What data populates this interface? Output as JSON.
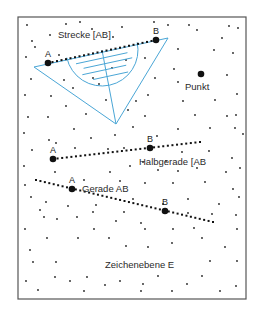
{
  "frame": {
    "x": 18,
    "y": 17,
    "w": 228,
    "h": 282,
    "stroke": "#555555"
  },
  "colors": {
    "ink": "#111111",
    "ruler": "#4aa6d6",
    "dot": "#222222"
  },
  "labels": {
    "strecke": "Strecke [AB]",
    "punkt": "Punkt",
    "halbgerade": "Halbgerade [AB",
    "gerade": "Gerade AB",
    "zeichenebene": "Zeichenebene E"
  },
  "points": {
    "strecke_a": {
      "label": "A",
      "x": 48,
      "y": 63
    },
    "strecke_b": {
      "label": "B",
      "x": 156,
      "y": 40
    },
    "punkt": {
      "x": 201,
      "y": 74
    },
    "halbgerade_a": {
      "label": "A",
      "x": 53,
      "y": 159
    },
    "halbgerade_b": {
      "label": "B",
      "x": 150,
      "y": 148
    },
    "gerade_a": {
      "label": "A",
      "x": 72,
      "y": 189
    },
    "gerade_b": {
      "label": "B",
      "x": 165,
      "y": 211
    }
  },
  "lines": {
    "strecke": {
      "x1": 48,
      "y1": 63,
      "x2": 156,
      "y2": 40
    },
    "halbgerade": {
      "x1": 53,
      "y1": 159,
      "x2": 200,
      "y2": 142
    },
    "gerade": {
      "x1": 36,
      "y1": 180,
      "x2": 213,
      "y2": 222
    }
  },
  "ruler": {
    "triangle": [
      [
        34,
        67
      ],
      [
        168,
        38
      ],
      [
        116,
        124
      ]
    ],
    "protractor": {
      "cx": 102,
      "cy": 50,
      "r": 36
    }
  },
  "scatter_dots": [
    [
      27,
      25
    ],
    [
      50,
      35
    ],
    [
      32,
      41
    ],
    [
      66,
      24
    ],
    [
      80,
      22
    ],
    [
      92,
      29
    ],
    [
      122,
      27
    ],
    [
      154,
      22
    ],
    [
      168,
      25
    ],
    [
      189,
      25
    ],
    [
      197,
      30
    ],
    [
      229,
      26
    ],
    [
      238,
      28
    ],
    [
      26,
      57
    ],
    [
      35,
      47
    ],
    [
      59,
      55
    ],
    [
      113,
      37
    ],
    [
      222,
      38
    ],
    [
      178,
      49
    ],
    [
      214,
      50
    ],
    [
      233,
      53
    ],
    [
      31,
      79
    ],
    [
      51,
      96
    ],
    [
      25,
      95
    ],
    [
      64,
      80
    ],
    [
      73,
      88
    ],
    [
      93,
      78
    ],
    [
      99,
      84
    ],
    [
      112,
      68
    ],
    [
      126,
      60
    ],
    [
      145,
      58
    ],
    [
      174,
      69
    ],
    [
      178,
      82
    ],
    [
      227,
      75
    ],
    [
      237,
      94
    ],
    [
      236,
      115
    ],
    [
      155,
      78
    ],
    [
      136,
      101
    ],
    [
      148,
      95
    ],
    [
      183,
      101
    ],
    [
      215,
      100
    ],
    [
      28,
      117
    ],
    [
      48,
      117
    ],
    [
      66,
      106
    ],
    [
      86,
      114
    ],
    [
      106,
      100
    ],
    [
      128,
      110
    ],
    [
      145,
      116
    ],
    [
      195,
      115
    ],
    [
      227,
      116
    ],
    [
      24,
      133
    ],
    [
      49,
      140
    ],
    [
      74,
      129
    ],
    [
      91,
      138
    ],
    [
      115,
      135
    ],
    [
      133,
      127
    ],
    [
      157,
      136
    ],
    [
      178,
      129
    ],
    [
      210,
      128
    ],
    [
      235,
      128
    ],
    [
      243,
      134
    ],
    [
      32,
      150
    ],
    [
      56,
      143
    ],
    [
      75,
      148
    ],
    [
      108,
      149
    ],
    [
      124,
      148
    ],
    [
      143,
      162
    ],
    [
      166,
      161
    ],
    [
      182,
      152
    ],
    [
      209,
      151
    ],
    [
      232,
      158
    ],
    [
      240,
      168
    ],
    [
      24,
      166
    ],
    [
      55,
      172
    ],
    [
      110,
      172
    ],
    [
      130,
      166
    ],
    [
      158,
      170
    ],
    [
      178,
      171
    ],
    [
      197,
      168
    ],
    [
      226,
      172
    ],
    [
      25,
      185
    ],
    [
      84,
      180
    ],
    [
      120,
      181
    ],
    [
      145,
      183
    ],
    [
      173,
      183
    ],
    [
      205,
      182
    ],
    [
      233,
      189
    ],
    [
      31,
      197
    ],
    [
      46,
      202
    ],
    [
      68,
      206
    ],
    [
      96,
      205
    ],
    [
      133,
      199
    ],
    [
      163,
      204
    ],
    [
      188,
      199
    ],
    [
      219,
      204
    ],
    [
      239,
      197
    ],
    [
      40,
      210
    ],
    [
      57,
      219
    ],
    [
      93,
      212
    ],
    [
      124,
      212
    ],
    [
      141,
      223
    ],
    [
      188,
      213
    ],
    [
      212,
      214
    ],
    [
      236,
      215
    ],
    [
      44,
      217
    ],
    [
      77,
      217
    ],
    [
      94,
      229
    ],
    [
      116,
      221
    ],
    [
      145,
      229
    ],
    [
      173,
      229
    ],
    [
      194,
      228
    ],
    [
      237,
      229
    ],
    [
      25,
      229
    ],
    [
      47,
      238
    ],
    [
      78,
      238
    ],
    [
      109,
      238
    ],
    [
      126,
      246
    ],
    [
      148,
      247
    ],
    [
      172,
      243
    ],
    [
      202,
      238
    ],
    [
      225,
      247
    ],
    [
      30,
      250
    ],
    [
      56,
      262
    ],
    [
      33,
      262
    ],
    [
      210,
      261
    ],
    [
      237,
      261
    ],
    [
      55,
      277
    ],
    [
      70,
      281
    ],
    [
      87,
      277
    ],
    [
      158,
      276
    ],
    [
      202,
      276
    ],
    [
      26,
      281
    ],
    [
      38,
      290
    ],
    [
      84,
      291
    ],
    [
      105,
      285
    ],
    [
      120,
      281
    ],
    [
      143,
      284
    ],
    [
      172,
      291
    ],
    [
      187,
      284
    ],
    [
      220,
      291
    ],
    [
      236,
      286
    ],
    [
      141,
      291
    ]
  ]
}
